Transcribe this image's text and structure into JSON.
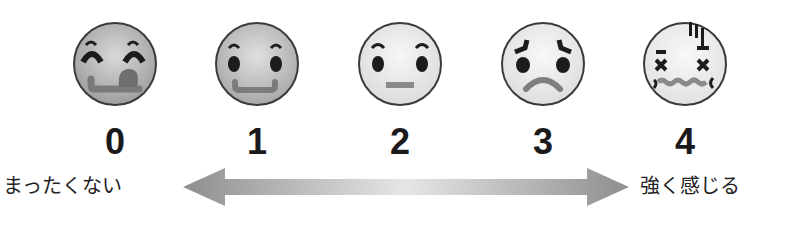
{
  "scale": {
    "faces": [
      {
        "value": "0",
        "expression": "very-happy"
      },
      {
        "value": "1",
        "expression": "smiling"
      },
      {
        "value": "2",
        "expression": "neutral"
      },
      {
        "value": "3",
        "expression": "sad"
      },
      {
        "value": "4",
        "expression": "distressed"
      }
    ],
    "left_label": "まったくない",
    "right_label": "強く感じる",
    "arrow": "double-headed-gradient-arrow"
  },
  "colors": {
    "face_outline": "#3a3a3a",
    "feature_dark": "#1c1c1c",
    "mouth_gray": "#8a8a8a",
    "arrow_gray": "#9a9a9a"
  }
}
